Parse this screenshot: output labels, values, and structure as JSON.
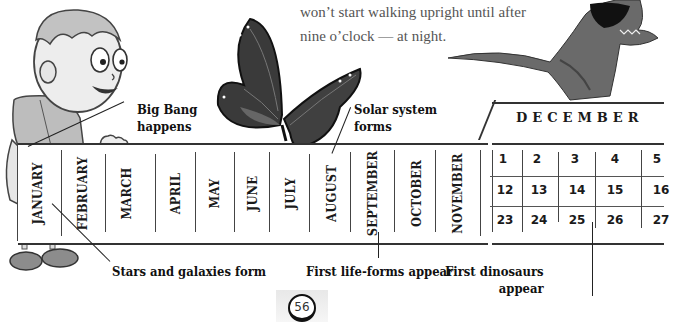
{
  "body_text": {
    "lines": [
      "won’t start walking upright until after",
      "nine o’clock — at night."
    ]
  },
  "timeline": {
    "months": [
      "JANUARY",
      "FEBRUARY",
      "MARCH",
      "APRIL",
      "MAY",
      "JUNE",
      "JULY",
      "AUGUST",
      "SEPTEMBER",
      "OCTOBER",
      "NOVEMBER"
    ],
    "december": {
      "title": "DECEMBER",
      "rows": [
        [
          "1",
          "2",
          "3",
          "4",
          "5"
        ],
        [
          "12",
          "13",
          "14",
          "15",
          "16"
        ],
        [
          "23",
          "24",
          "25",
          "26",
          "27"
        ]
      ]
    }
  },
  "annotations": {
    "big_bang": [
      "Big Bang",
      "happens"
    ],
    "solar_system": [
      "Solar system",
      "forms"
    ],
    "stars_galaxies": "Stars and galaxies form",
    "first_life": "First life-forms appear",
    "first_dinosaurs": [
      "First dinosaurs",
      "appear"
    ]
  },
  "illustrations": {
    "boy": "cartoon-boy-holding-timeline",
    "butterfly": "monarch-butterfly",
    "dinosaur": "tyrannosaurus-rex"
  },
  "page": {
    "number": "56"
  }
}
